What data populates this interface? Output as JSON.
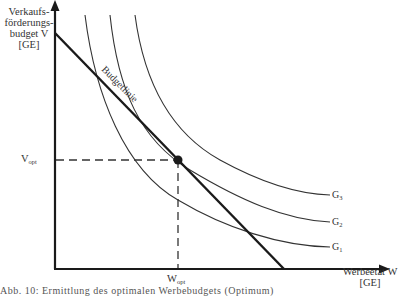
{
  "diagram": {
    "type": "indifference-curve-optimum",
    "y_axis": {
      "label_line1": "Verkaufs-",
      "label_line2": "förderungs-",
      "label_line3": "budget V",
      "unit": "[GE]"
    },
    "x_axis": {
      "label": "Werbeetat W",
      "unit": "[GE]"
    },
    "budget_line_label": "Budgetlinie",
    "optimum": {
      "v_label": "V",
      "v_sub": "opt",
      "w_label": "W",
      "w_sub": "opt"
    },
    "curves": [
      {
        "name": "G",
        "sub": "1"
      },
      {
        "name": "G",
        "sub": "2"
      },
      {
        "name": "G",
        "sub": "3"
      }
    ],
    "caption": "Abb. 10: Ermittlung des optimalen Werbebudgets (Optimum)"
  }
}
